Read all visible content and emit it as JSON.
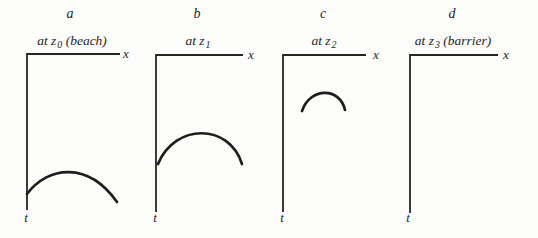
{
  "figure": {
    "background": "#fcfcfa",
    "ink": "#242424",
    "description_hint": "",
    "panels": [
      {
        "title": "a",
        "position_label": {
          "prefix": "at z",
          "subscript": "0",
          "suffix": " (beach)"
        },
        "x_axis_label": "x",
        "t_axis_label": "t",
        "has_curve": true,
        "geometry": {
          "title_tf": "translate(70 18)",
          "subtitle_tf": "translate(72 45)",
          "axis_d": "M 120 54 L 27 54 L 27 210",
          "curve_d": "M 27 194 C 48 166 88 161 117 202",
          "x_label_tf": "translate(126 58)",
          "t_label_tf": "translate(26 222)"
        }
      },
      {
        "title": "b",
        "position_label": {
          "prefix": "at z",
          "subscript": "1",
          "suffix": ""
        },
        "x_axis_label": "x",
        "t_axis_label": "t",
        "has_curve": true,
        "geometry": {
          "title_tf": "translate(197 18)",
          "subtitle_tf": "translate(198 45)",
          "axis_d": "M 243 55 L 156 55 L 156 212",
          "curve_d": "M 158 164 C 175 123 229 123 242 164",
          "x_label_tf": "translate(251 59)",
          "t_label_tf": "translate(155 222)"
        }
      },
      {
        "title": "c",
        "position_label": {
          "prefix": "at z",
          "subscript": "2",
          "suffix": ""
        },
        "x_axis_label": "x",
        "t_axis_label": "t",
        "has_curve": true,
        "geometry": {
          "title_tf": "translate(323 18)",
          "subtitle_tf": "translate(324 45)",
          "axis_d": "M 366 55 L 283 55 L 283 212",
          "curve_d": "M 302 111 C 310 87 340 87 345 110",
          "x_label_tf": "translate(376 59)",
          "t_label_tf": "translate(282 222)"
        }
      },
      {
        "title": "d",
        "position_label": {
          "prefix": "at z",
          "subscript": "3",
          "suffix": " (barrier)"
        },
        "x_axis_label": "x",
        "t_axis_label": "t",
        "has_curve": false,
        "geometry": {
          "title_tf": "translate(452 18)",
          "subtitle_tf": "translate(453 45)",
          "axis_d": "M 498 55 L 410 55 L 410 213",
          "curve_d": "",
          "x_label_tf": "translate(506 59)",
          "t_label_tf": "translate(408 222)"
        }
      }
    ]
  }
}
